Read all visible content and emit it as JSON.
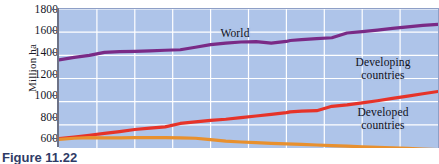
{
  "chart_data": {
    "type": "line",
    "title": "",
    "xlabel": "",
    "ylabel": "Million ha",
    "ylim": [
      600,
      1800
    ],
    "yticks": [
      600,
      800,
      1000,
      1200,
      1400,
      1600,
      1800
    ],
    "xlim": [
      0,
      100
    ],
    "grid": true,
    "legend_position": "inline-labels",
    "background_color": "#aec4e9",
    "gridline_color": "#ffffff",
    "series": [
      {
        "name": "World",
        "color": "#7a2a86",
        "label_text": "World",
        "start_value": 1360,
        "end_value": 1670,
        "x": [
          0,
          4,
          8,
          12,
          16,
          20,
          24,
          28,
          32,
          36,
          40,
          44,
          48,
          52,
          56,
          60,
          61,
          64,
          68,
          72,
          76,
          80,
          84,
          88,
          92,
          96,
          100
        ],
        "values": [
          1360,
          1383,
          1400,
          1425,
          1432,
          1434,
          1438,
          1444,
          1448,
          1470,
          1492,
          1506,
          1515,
          1518,
          1505,
          1520,
          1528,
          1535,
          1545,
          1552,
          1593,
          1605,
          1618,
          1632,
          1645,
          1658,
          1668
        ]
      },
      {
        "name": "Developing countries",
        "color": "#e63329",
        "label_text": "Developing countries",
        "start_value": 682,
        "end_value": 1088,
        "x": [
          0,
          4,
          8,
          12,
          16,
          20,
          24,
          28,
          32,
          36,
          40,
          44,
          48,
          52,
          56,
          60,
          61,
          64,
          68,
          72,
          76,
          80,
          84,
          88,
          92,
          96,
          100
        ],
        "values": [
          682,
          695,
          710,
          726,
          742,
          760,
          772,
          782,
          812,
          826,
          838,
          848,
          862,
          876,
          890,
          905,
          912,
          918,
          922,
          960,
          972,
          990,
          1008,
          1028,
          1048,
          1068,
          1088
        ]
      },
      {
        "name": "Developed countries",
        "color": "#e8902e",
        "label_text": "Developed countries",
        "start_value": 675,
        "end_value": 586,
        "x": [
          0,
          4,
          8,
          12,
          16,
          20,
          24,
          28,
          32,
          36,
          40,
          44,
          48,
          52,
          56,
          60,
          64,
          68,
          72,
          76,
          80,
          84,
          88,
          92,
          96,
          100
        ],
        "values": [
          675,
          684,
          690,
          688,
          688,
          689,
          690,
          690,
          688,
          684,
          672,
          660,
          652,
          646,
          640,
          636,
          631,
          626,
          621,
          616,
          611,
          606,
          601,
          596,
          591,
          586
        ]
      }
    ],
    "annotations": [
      {
        "text": "World",
        "series": "World"
      },
      {
        "text": "Developing countries",
        "series": "Developing countries"
      },
      {
        "text": "Developed countries",
        "series": "Developed countries"
      }
    ]
  },
  "axis": {
    "y_title": "Million ha",
    "tick_labels": [
      "1800",
      "1600",
      "1400",
      "1200",
      "1000",
      "800",
      "600"
    ]
  },
  "labels": {
    "world": "World",
    "developing_line1": "Developing",
    "developing_line2": "countries",
    "developed_line1": "Developed",
    "developed_line2": "countries"
  },
  "caption": {
    "text": "Figure  11.22"
  }
}
